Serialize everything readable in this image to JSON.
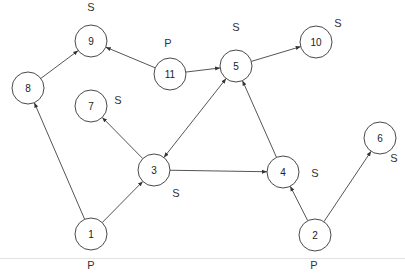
{
  "diagram": {
    "type": "directed-graph",
    "nodes": [
      {
        "id": "1",
        "x": 91,
        "y": 234,
        "tag": "P",
        "tag_x": 91,
        "tag_y": 265
      },
      {
        "id": "2",
        "x": 315,
        "y": 235,
        "tag": "P",
        "tag_x": 314,
        "tag_y": 265
      },
      {
        "id": "3",
        "x": 154,
        "y": 170,
        "tag": "S",
        "tag_x": 176,
        "tag_y": 193
      },
      {
        "id": "4",
        "x": 283,
        "y": 172,
        "tag": "S",
        "tag_x": 315,
        "tag_y": 173
      },
      {
        "id": "5",
        "x": 236,
        "y": 66,
        "tag": "S",
        "tag_x": 236,
        "tag_y": 27
      },
      {
        "id": "6",
        "x": 380,
        "y": 138,
        "tag": "S",
        "tag_x": 394,
        "tag_y": 158
      },
      {
        "id": "7",
        "x": 91,
        "y": 106,
        "tag": "S",
        "tag_x": 118,
        "tag_y": 100
      },
      {
        "id": "8",
        "x": 28,
        "y": 88,
        "tag": "",
        "tag_x": 0,
        "tag_y": 0
      },
      {
        "id": "9",
        "x": 91,
        "y": 41,
        "tag": "S",
        "tag_x": 91,
        "tag_y": 7
      },
      {
        "id": "10",
        "x": 316,
        "y": 42,
        "tag": "S",
        "tag_x": 338,
        "tag_y": 23
      },
      {
        "id": "11",
        "x": 170,
        "y": 74,
        "tag": "P",
        "tag_x": 168,
        "tag_y": 43
      }
    ],
    "edges": [
      {
        "from": "1",
        "to": "8",
        "bidirectional": false
      },
      {
        "from": "8",
        "to": "9",
        "bidirectional": false
      },
      {
        "from": "11",
        "to": "9",
        "bidirectional": false
      },
      {
        "from": "11",
        "to": "5",
        "bidirectional": false
      },
      {
        "from": "5",
        "to": "10",
        "bidirectional": false
      },
      {
        "from": "3",
        "to": "7",
        "bidirectional": false
      },
      {
        "from": "1",
        "to": "3",
        "bidirectional": false
      },
      {
        "from": "5",
        "to": "3",
        "bidirectional": true
      },
      {
        "from": "3",
        "to": "4",
        "bidirectional": false
      },
      {
        "from": "4",
        "to": "5",
        "bidirectional": false
      },
      {
        "from": "2",
        "to": "4",
        "bidirectional": false
      },
      {
        "from": "2",
        "to": "6",
        "bidirectional": false
      }
    ],
    "node_radius": 16,
    "colors": {
      "stroke": "#4a4a4a",
      "edge": "#555555",
      "text": "#222222",
      "background": "#ffffff"
    },
    "legend": {
      "P": "P",
      "S": "S"
    }
  }
}
